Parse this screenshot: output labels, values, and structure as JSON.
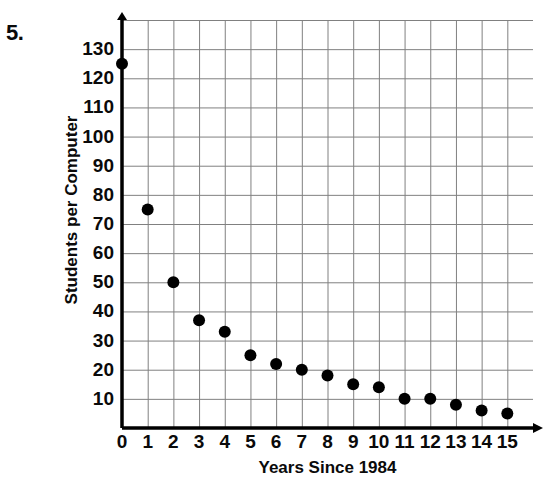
{
  "problem": {
    "number": "5."
  },
  "chart_data": {
    "type": "scatter",
    "title": "",
    "xlabel": "Years Since 1984",
    "ylabel": "Students per Computer",
    "xlim": [
      0,
      16
    ],
    "ylim": [
      0,
      140
    ],
    "xticks": [
      "0",
      "1",
      "2",
      "3",
      "4",
      "5",
      "6",
      "7",
      "8",
      "9",
      "10",
      "11",
      "12",
      "13",
      "14",
      "15"
    ],
    "yticks": [
      "130",
      "120",
      "110",
      "100",
      "90",
      "80",
      "70",
      "60",
      "50",
      "40",
      "30",
      "20",
      "10"
    ],
    "grid": true,
    "legend": false,
    "x": [
      0,
      1,
      2,
      3,
      4,
      5,
      6,
      7,
      8,
      9,
      10,
      11,
      12,
      13,
      14,
      15
    ],
    "values": [
      125,
      75,
      50,
      37,
      33,
      25,
      22,
      20,
      18,
      15,
      14,
      10,
      10,
      8,
      6,
      5
    ],
    "marker": {
      "shape": "circle",
      "color": "#000000",
      "size": 9
    },
    "axis_color": "#000000",
    "grid_color": "#808080"
  }
}
